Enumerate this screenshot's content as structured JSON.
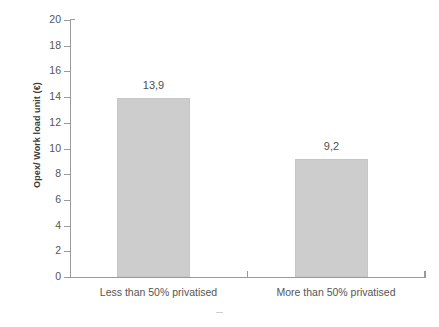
{
  "chart_data": {
    "type": "bar",
    "title": "",
    "subtitle": "",
    "xlabel": "",
    "ylabel": "Opex/ Work load unit (€)",
    "categories": [
      "Less than 50% privatised",
      "More than 50% privatised"
    ],
    "values": [
      13.9,
      9.2
    ],
    "value_labels": [
      "13,9",
      "9,2"
    ],
    "ylim": [
      0,
      20
    ],
    "ytick_values": [
      0,
      2,
      4,
      6,
      8,
      10,
      12,
      14,
      16,
      18,
      20
    ],
    "ytick_labels": [
      "0",
      "2",
      "4",
      "6",
      "8",
      "10",
      "12",
      "14",
      "16",
      "18",
      "20"
    ],
    "grid": false,
    "legend": null,
    "legend_position": "none",
    "bar_color": "#cdcdcd",
    "axis_color": "#9a9a9a",
    "text_color": "#555555",
    "background": "#ffffff",
    "decimal_separator": ","
  }
}
